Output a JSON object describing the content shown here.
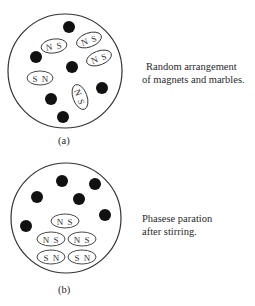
{
  "panels": [
    {
      "id": "a",
      "label": "(a)",
      "caption_lines": [
        "Random arrangement",
        "of magnets and marbles."
      ],
      "circle": {
        "cx": 65,
        "cy": 71,
        "r": 57
      },
      "marbles": [
        {
          "cx": 69,
          "cy": 27
        },
        {
          "cx": 36,
          "cy": 57
        },
        {
          "cx": 72,
          "cy": 67
        },
        {
          "cx": 102,
          "cy": 88
        },
        {
          "cx": 51,
          "cy": 99
        },
        {
          "cx": 63,
          "cy": 117
        }
      ],
      "magnets": [
        {
          "cx": 54,
          "cy": 46,
          "rx": 13,
          "ry": 7,
          "rot": -8,
          "left": "N",
          "right": "S"
        },
        {
          "cx": 89,
          "cy": 40,
          "rx": 13,
          "ry": 7,
          "rot": -20,
          "left": "N",
          "right": "S"
        },
        {
          "cx": 99,
          "cy": 58,
          "rx": 13,
          "ry": 7,
          "rot": -20,
          "left": "N",
          "right": "S"
        },
        {
          "cx": 40,
          "cy": 78,
          "rx": 13,
          "ry": 7,
          "rot": 0,
          "left": "S",
          "right": "N"
        },
        {
          "cx": 80,
          "cy": 97,
          "rx": 13,
          "ry": 7,
          "rot": 70,
          "left": "N",
          "right": "S"
        }
      ]
    },
    {
      "id": "b",
      "label": "(b)",
      "caption_lines": [
        "Phasese paration",
        "after stirring."
      ],
      "circle": {
        "cx": 66,
        "cy": 218,
        "r": 55
      },
      "marbles": [
        {
          "cx": 62,
          "cy": 181
        },
        {
          "cx": 95,
          "cy": 184
        },
        {
          "cx": 37,
          "cy": 197
        },
        {
          "cx": 79,
          "cy": 199
        },
        {
          "cx": 105,
          "cy": 215
        },
        {
          "cx": 26,
          "cy": 226
        }
      ],
      "magnets": [
        {
          "cx": 65,
          "cy": 221,
          "rx": 14,
          "ry": 7,
          "rot": 0,
          "left": "N",
          "right": "S"
        },
        {
          "cx": 51,
          "cy": 239,
          "rx": 14,
          "ry": 7,
          "rot": 0,
          "left": "N",
          "right": "S"
        },
        {
          "cx": 82,
          "cy": 239,
          "rx": 14,
          "ry": 7,
          "rot": 0,
          "left": "N",
          "right": "S"
        },
        {
          "cx": 51,
          "cy": 257,
          "rx": 14,
          "ry": 7,
          "rot": 0,
          "left": "S",
          "right": "N"
        },
        {
          "cx": 82,
          "cy": 257,
          "rx": 14,
          "ry": 7,
          "rot": 0,
          "left": "S",
          "right": "N"
        }
      ]
    }
  ],
  "style": {
    "stroke": "#333333",
    "marble_fill": "#111111",
    "marble_r": 6
  }
}
